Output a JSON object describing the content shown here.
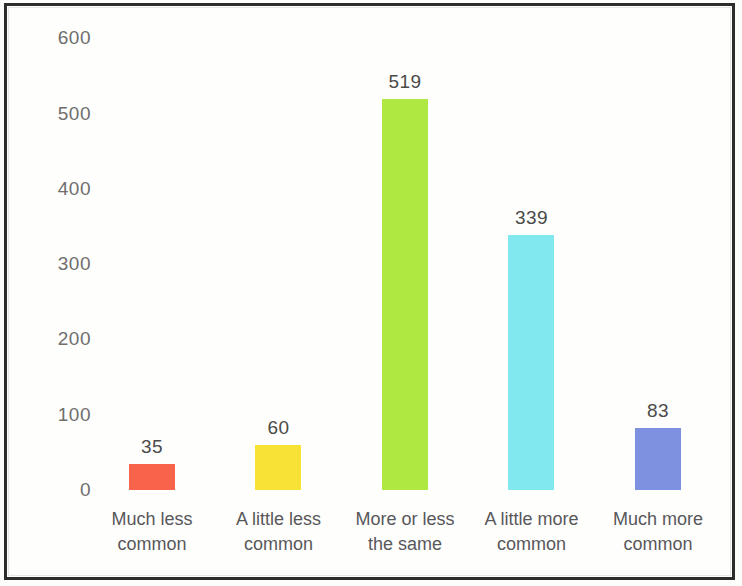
{
  "chart_data": {
    "type": "bar",
    "title": "",
    "subtitle": "",
    "xlabel": "",
    "ylabel": "",
    "categories": [
      "Much less common",
      "A little less common",
      "More or less the same",
      "A little more common",
      "Much more common"
    ],
    "category_lines": [
      [
        "Much less",
        "common"
      ],
      [
        "A little less",
        "common"
      ],
      [
        "More or less",
        "the same"
      ],
      [
        "A little more",
        "common"
      ],
      [
        "Much more",
        "common"
      ]
    ],
    "values": [
      35,
      60,
      519,
      339,
      83
    ],
    "value_labels": [
      "35",
      "60",
      "519",
      "339",
      "83"
    ],
    "colors": [
      "#F8634B",
      "#F7E235",
      "#AEE840",
      "#80E8EE",
      "#7D91E0"
    ],
    "ylim": [
      0,
      600
    ],
    "yticks": [
      0,
      100,
      200,
      300,
      400,
      500,
      600
    ],
    "ytick_labels": [
      "0",
      "100",
      "200",
      "300",
      "400",
      "500",
      "600"
    ],
    "grid": false,
    "legend": "none",
    "axis_line": false,
    "background": "#FFFFFF",
    "frame_color": "#2E2D2B"
  }
}
